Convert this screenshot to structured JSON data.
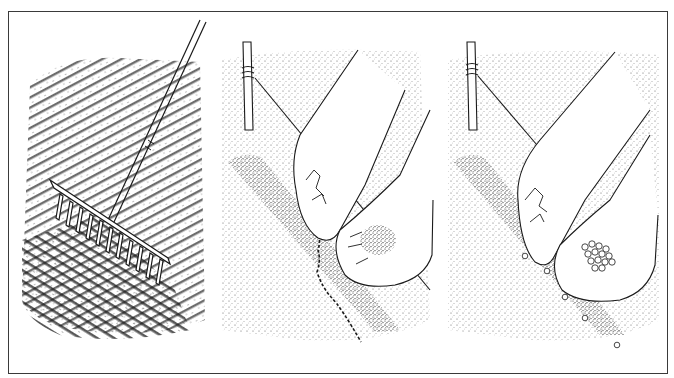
{
  "figure": {
    "colors": {
      "ink": "#1a1a1a",
      "paper": "#ffffff",
      "border": "#3a3a3a"
    },
    "panels": [
      {
        "id": "rake",
        "subject": "garden rake levelling soil into parallel furrows"
      },
      {
        "id": "fine-seed",
        "subject": "hands sowing fine seed thinly into a drill beside a garden line and stake"
      },
      {
        "id": "large-seed",
        "subject": "hands placing large round seeds individually along the drill beside a garden line and stake"
      }
    ]
  }
}
